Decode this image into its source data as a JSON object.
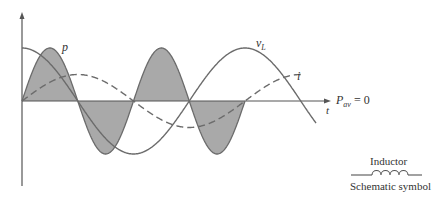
{
  "diagram": {
    "labels": {
      "power": "p",
      "voltage": "v",
      "voltage_sub": "L",
      "current": "i",
      "time_axis": "t",
      "avg_power": "P",
      "avg_power_sub": "av",
      "avg_power_value": "= 0"
    },
    "symbol": {
      "name": "Inductor",
      "caption": "Schematic symbol"
    },
    "curves": [
      {
        "name": "v_L",
        "style": "solid",
        "phase_deg": 90,
        "amplitude": 1.0
      },
      {
        "name": "i",
        "style": "dashed",
        "phase_deg": 0,
        "amplitude": 0.5
      },
      {
        "name": "p",
        "style": "solid-filled",
        "note": "double frequency, zero average"
      }
    ],
    "colors": {
      "line": "#6b6b6b",
      "fill": "#a9a9a9",
      "text": "#333333"
    }
  }
}
